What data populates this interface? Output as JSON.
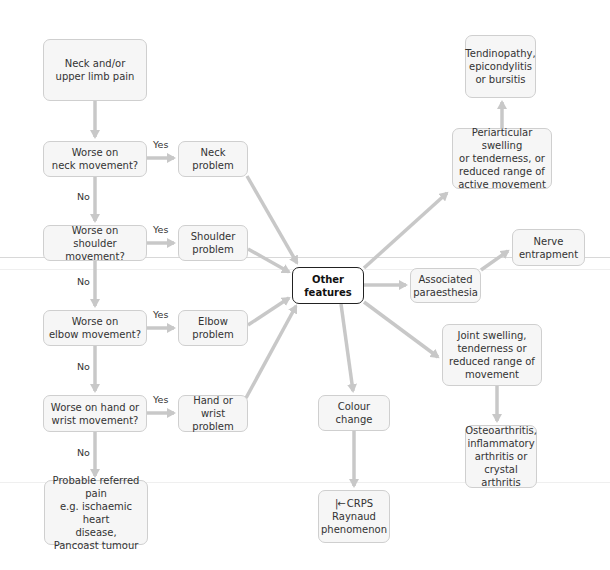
{
  "diagram": {
    "type": "flowchart",
    "colors": {
      "box_fill": "#f6f6f6",
      "box_border": "#cfcfcf",
      "arrow": "#c8c8c8",
      "central_border": "#222222"
    },
    "nodes": {
      "start": "Neck and/or\nupper limb pain",
      "q_neck": "Worse on\nneck movement?",
      "q_shoulder": "Worse on\nshoulder movement?",
      "q_elbow": "Worse on\nelbow movement?",
      "q_hand": "Worse on hand or\nwrist movement?",
      "referred": "Probable referred pain\ne.g. ischaemic heart\ndisease,\nPancoast tumour",
      "neck_problem": "Neck\nproblem",
      "shoulder_problem": "Shoulder\nproblem",
      "elbow_problem": "Elbow\nproblem",
      "hand_problem": "Hand or wrist\nproblem",
      "other_features": "Other\nfeatures",
      "paraesthesia": "Associated\nparaesthesia",
      "nerve": "Nerve\nentrapment",
      "periarticular": "Periarticular swelling\nor tenderness, or\nreduced range of\nactive movement",
      "tendinopathy": "Tendinopathy,\nepicondylitis\nor bursitis",
      "joint_swelling": "Joint swelling,\ntenderness or\nreduced range of\nmovement",
      "arthritis": "Osteoarthritis,\ninflammatory\narthritis or\ncrystal arthritis",
      "colour_change": "Colour change",
      "crps_first": "CRPS",
      "crps_rest": "Raynaud\nphenomenon"
    },
    "labels": {
      "yes": "Yes",
      "no": "No"
    },
    "edges": [
      [
        "start",
        "q_neck",
        ""
      ],
      [
        "q_neck",
        "neck_problem",
        "Yes"
      ],
      [
        "q_neck",
        "q_shoulder",
        "No"
      ],
      [
        "q_shoulder",
        "shoulder_problem",
        "Yes"
      ],
      [
        "q_shoulder",
        "q_elbow",
        "No"
      ],
      [
        "q_elbow",
        "elbow_problem",
        "Yes"
      ],
      [
        "q_elbow",
        "q_hand",
        "No"
      ],
      [
        "q_hand",
        "hand_problem",
        "Yes"
      ],
      [
        "q_hand",
        "referred",
        "No"
      ],
      [
        "neck_problem",
        "other_features",
        ""
      ],
      [
        "shoulder_problem",
        "other_features",
        ""
      ],
      [
        "elbow_problem",
        "other_features",
        ""
      ],
      [
        "hand_problem",
        "other_features",
        ""
      ],
      [
        "other_features",
        "periarticular",
        ""
      ],
      [
        "periarticular",
        "tendinopathy",
        ""
      ],
      [
        "other_features",
        "paraesthesia",
        ""
      ],
      [
        "paraesthesia",
        "nerve",
        ""
      ],
      [
        "other_features",
        "joint_swelling",
        ""
      ],
      [
        "joint_swelling",
        "arthritis",
        ""
      ],
      [
        "other_features",
        "colour_change",
        ""
      ],
      [
        "colour_change",
        "crps_first",
        ""
      ]
    ]
  }
}
